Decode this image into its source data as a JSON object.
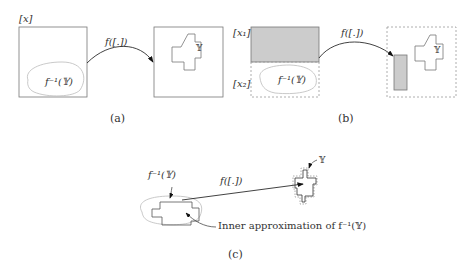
{
  "panel_a": {
    "caption": "(a)",
    "domain_label": "[x]",
    "preimage_label": "f⁻¹(𝕐)",
    "map_label": "f([.])",
    "target_label": "𝕐"
  },
  "panel_b": {
    "caption": "(b)",
    "box1_label": "[x₁]",
    "box2_label": "[x₂]",
    "preimage_label": "f⁻¹(𝕐)",
    "map_label": "f([.])",
    "target_label": "𝕐"
  },
  "panel_c": {
    "caption": "(c)",
    "preimage_label": "f⁻¹(𝕐)",
    "map_label": "f([.])",
    "target_label": "𝕐",
    "inner_approx_label": "Inner approximation of f⁻¹(𝕐)"
  }
}
